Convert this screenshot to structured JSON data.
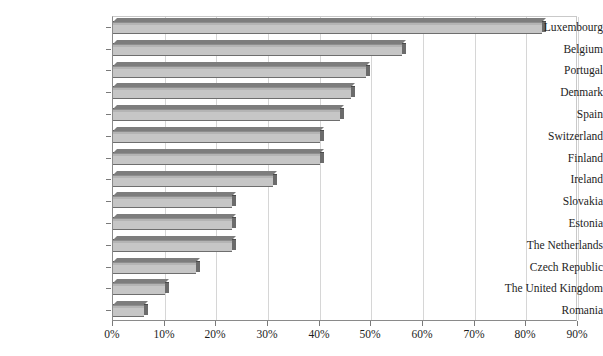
{
  "chart_data": {
    "type": "bar",
    "orientation": "horizontal",
    "title": "",
    "subtitle": "",
    "xlabel": "",
    "ylabel": "",
    "categories": [
      "Luxembourg",
      "Belgium",
      "Portugal",
      "Denmark",
      "Spain",
      "Switzerland",
      "Finland",
      "Ireland",
      "Slovakia",
      "Estonia",
      "The Netherlands",
      "Czech Republic",
      "The United Kingdom",
      "Romania"
    ],
    "values": [
      83,
      56,
      49,
      46,
      44,
      40,
      40,
      31,
      23,
      23,
      23,
      16,
      10,
      6
    ],
    "value_unit": "%",
    "xlim": [
      0,
      90
    ],
    "xticks": [
      0,
      10,
      20,
      30,
      40,
      50,
      60,
      70,
      80,
      90
    ],
    "xtick_labels": [
      "0%",
      "10%",
      "20%",
      "30%",
      "40%",
      "50%",
      "60%",
      "70%",
      "80%",
      "90%"
    ],
    "grid": "vertical",
    "legend": "none",
    "bar_style": "3d-gray",
    "colors": {
      "bar_face": "#c6c6c6",
      "bar_edge": "#4a4a4a",
      "bar_side": "#6b6b6b",
      "gridline": "#d6d6d6",
      "axis": "#8a8a8a",
      "text": "#1d1d1d",
      "background": "#ffffff"
    }
  }
}
